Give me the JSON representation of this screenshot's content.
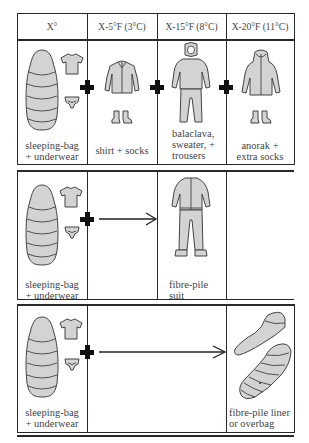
{
  "header": {
    "columns": [
      "X°",
      "X-5°F (3°C)",
      "X-15°F (8°C)",
      "X-20°F (11°C)"
    ]
  },
  "rows": [
    {
      "cells": [
        {
          "caption": "sleeping-bag\n+ underwear",
          "caption_lines": [
            "sleeping-bag",
            "+ underwear"
          ],
          "icons": [
            "sleeping-bag-icon",
            "t-shirt-icon",
            "underpants-icon"
          ]
        },
        {
          "caption": "shirt + socks",
          "caption_lines": [
            "shirt + socks"
          ],
          "icons": [
            "shirt-icon",
            "socks-icon"
          ]
        },
        {
          "caption": "balaclava, sweater, + trousers",
          "caption_lines": [
            "balaclava,",
            "sweater, +",
            "trousers"
          ],
          "icons": [
            "balaclava-icon",
            "sweater-icon",
            "trousers-icon"
          ]
        },
        {
          "caption": "anorak + extra socks",
          "caption_lines": [
            "anorak +",
            "extra socks"
          ],
          "icons": [
            "anorak-icon",
            "socks-icon"
          ]
        }
      ],
      "connectors": [
        "plus",
        "plus",
        "plus"
      ]
    },
    {
      "cells": [
        {
          "caption_lines": [
            "sleeping-bag",
            "+ underwear"
          ],
          "icons": [
            "sleeping-bag-icon",
            "t-shirt-icon",
            "underpants-icon"
          ]
        },
        {
          "caption_lines": [
            "fibre-pile",
            "suit"
          ],
          "icons": [
            "fibre-pile-suit-icon"
          ]
        }
      ],
      "connectors": [
        "plus",
        "arrow"
      ]
    },
    {
      "cells": [
        {
          "caption_lines": [
            "sleeping-bag",
            "+ underwear"
          ],
          "icons": [
            "sleeping-bag-icon",
            "t-shirt-icon",
            "underpants-icon"
          ]
        },
        {
          "caption_lines": [
            "fibre-pile liner",
            "or overbag"
          ],
          "icons": [
            "liner-icon",
            "overbag-icon"
          ]
        }
      ],
      "connectors": [
        "plus",
        "arrow"
      ]
    }
  ],
  "colors": {
    "line": "#2a2a2a",
    "figure_fill": "#d3d3d3",
    "figure_stroke": "#444444",
    "plus": "#111111",
    "text": "#444444"
  }
}
